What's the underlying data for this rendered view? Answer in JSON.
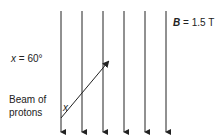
{
  "field": {
    "symbol": "B",
    "equals": " = 1.5 T",
    "line_count": 6,
    "direction": "down"
  },
  "angle": {
    "symbol": "x",
    "equals": " = 60°",
    "marker": "x"
  },
  "beam": {
    "label_line1": "Beam of",
    "label_line2": "protons"
  },
  "colors": {
    "line": "#222222",
    "background": "#ffffff"
  }
}
